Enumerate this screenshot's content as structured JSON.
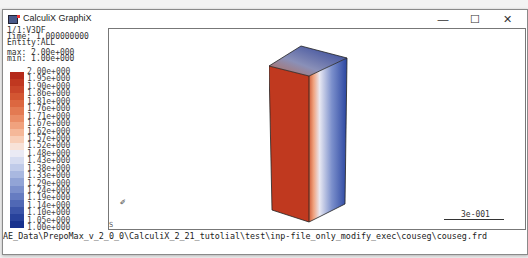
{
  "window": {
    "title": "CalculiX GraphiX",
    "controls": {
      "minimize": "—",
      "maximize": "☐",
      "close": "✕"
    }
  },
  "info": {
    "line1": "1/1:V3DF",
    "line2": "Time: 1.000000000",
    "line3": "Entity:ALL",
    "max": "max: 2.00e+000",
    "min": "min: 1.00e+000"
  },
  "legend": {
    "labels": [
      "2.00e+000",
      "1.95e+000",
      "1.90e+000",
      "1.86e+000",
      "1.81e+000",
      "1.76e+000",
      "1.71e+000",
      "1.67e+000",
      "1.62e+000",
      "1.57e+000",
      "1.52e+000",
      "1.48e+000",
      "1.43e+000",
      "1.38e+000",
      "1.33e+000",
      "1.29e+000",
      "1.24e+000",
      "1.19e+000",
      "1.14e+000",
      "1.10e+000",
      "1.05e+000",
      "1.00e+000"
    ],
    "colors": [
      "#b52a1a",
      "#c03820",
      "#c94529",
      "#d35632",
      "#dc6740",
      "#e37a52",
      "#ea8d66",
      "#f0a27e",
      "#f5b899",
      "#f8ceb7",
      "#f8e2d8",
      "#eaeaf4",
      "#d6dcf0",
      "#c0cbe9",
      "#a9b8e0",
      "#92a4d6",
      "#7c90cc",
      "#667cc1",
      "#5068b5",
      "#3b54a8",
      "#28429b",
      "#18328e"
    ]
  },
  "viewport": {
    "triad_glyph": "✐",
    "corner_label": "S",
    "scale_label": "3e-001"
  },
  "command_line": "AE_Data\\PrepoMax_v_2_0_0\\CalculiX_2_21_tutolial\\test\\inp-file_only_modify_exec\\couseg\\couseg.frd"
}
